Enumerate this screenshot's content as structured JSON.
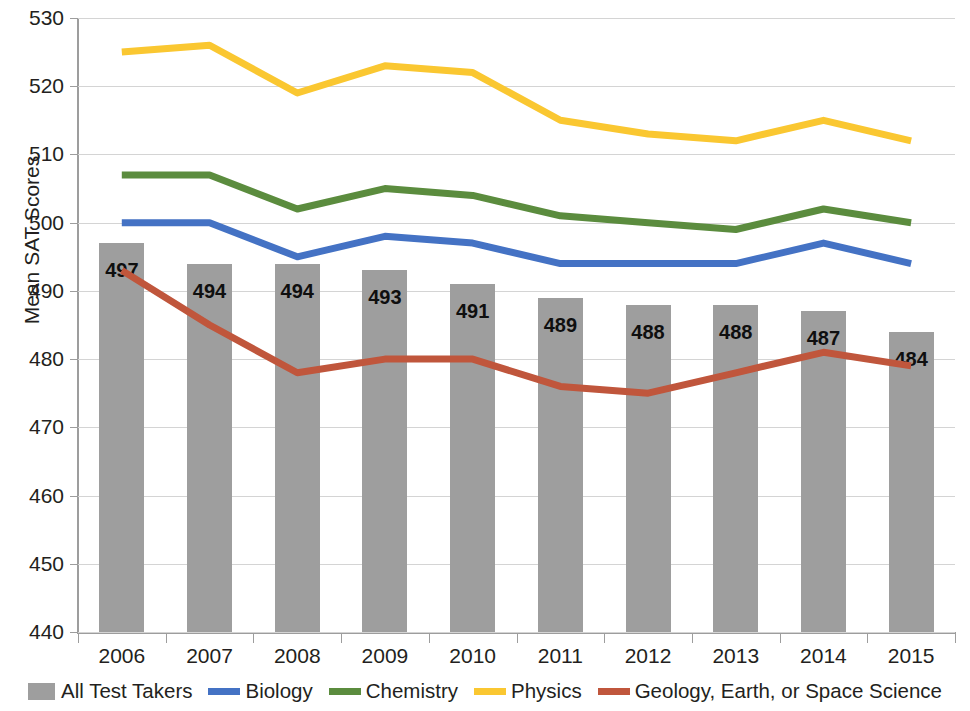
{
  "chart_data": {
    "type": "bar",
    "title": "",
    "xlabel": "",
    "ylabel": "Mean SAT Scores",
    "ylim": [
      440,
      530
    ],
    "ytick_step": 10,
    "grid": true,
    "legend_position": "bottom",
    "categories": [
      "2006",
      "2007",
      "2008",
      "2009",
      "2010",
      "2011",
      "2012",
      "2013",
      "2014",
      "2015"
    ],
    "ytick_labels": [
      "530",
      "520",
      "510",
      "500",
      "490",
      "480",
      "470",
      "460",
      "450",
      "440"
    ],
    "series": [
      {
        "name": "All Test Takers",
        "render": "bar",
        "color": "#9e9e9e",
        "show_labels": true,
        "values": [
          497,
          494,
          494,
          493,
          491,
          489,
          488,
          488,
          487,
          484
        ]
      },
      {
        "name": "Biology",
        "render": "line",
        "color": "#4472c4",
        "show_labels": false,
        "values": [
          500,
          500,
          495,
          498,
          497,
          494,
          494,
          494,
          497,
          494
        ]
      },
      {
        "name": "Chemistry",
        "render": "line",
        "color": "#5b8c3e",
        "show_labels": false,
        "values": [
          507,
          507,
          502,
          505,
          504,
          501,
          500,
          499,
          502,
          500
        ]
      },
      {
        "name": "Physics",
        "render": "line",
        "color": "#fac731",
        "show_labels": false,
        "values": [
          525,
          526,
          519,
          523,
          522,
          515,
          513,
          512,
          515,
          512
        ]
      },
      {
        "name": "Geology, Earth, or Space Science",
        "render": "line",
        "color": "#c0563c",
        "show_labels": false,
        "values": [
          493,
          485,
          478,
          480,
          480,
          476,
          475,
          478,
          481,
          479
        ]
      }
    ]
  },
  "legend": {
    "items": [
      {
        "label": "All Test Takers",
        "swatch": "box",
        "color": "#9e9e9e"
      },
      {
        "label": "Biology",
        "swatch": "line",
        "color": "#4472c4"
      },
      {
        "label": "Chemistry",
        "swatch": "line",
        "color": "#5b8c3e"
      },
      {
        "label": "Physics",
        "swatch": "line",
        "color": "#fac731"
      },
      {
        "label": "Geology, Earth, or Space Science",
        "swatch": "line",
        "color": "#c0563c"
      }
    ]
  }
}
